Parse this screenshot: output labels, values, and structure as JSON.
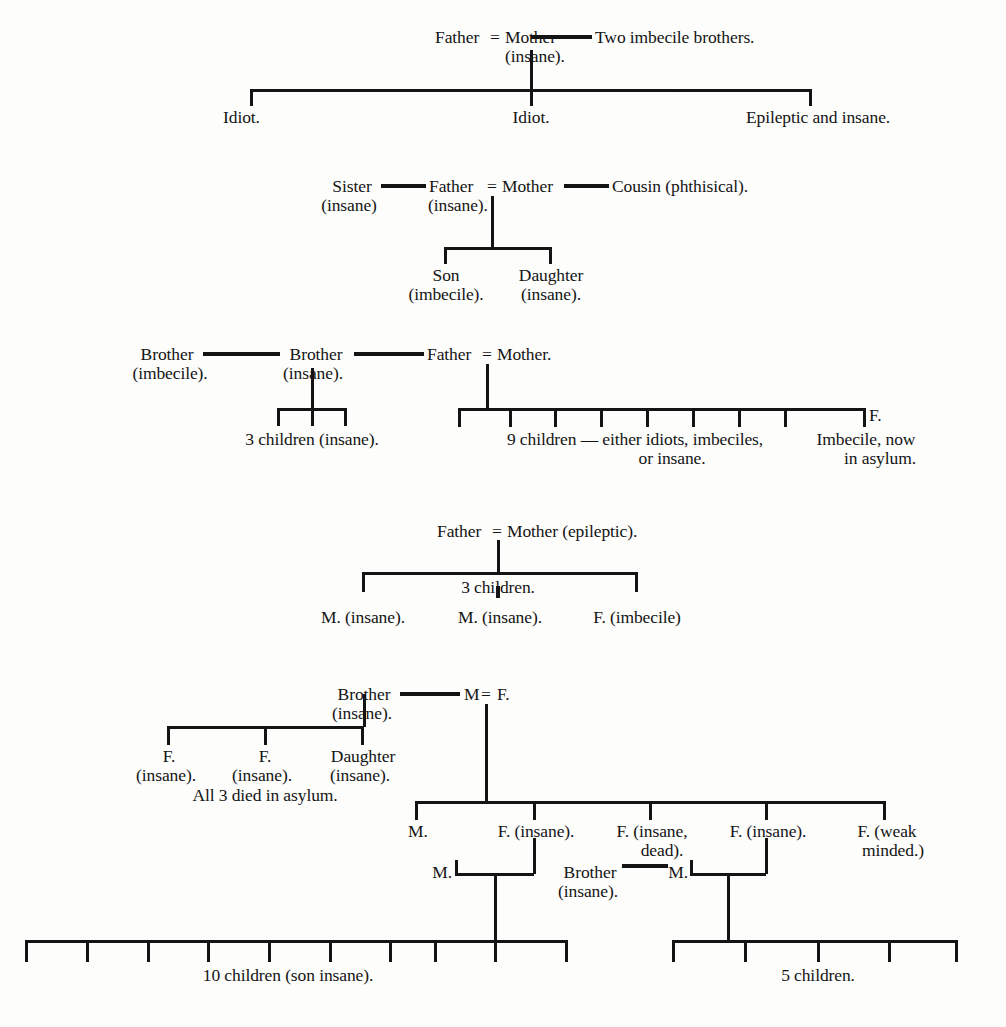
{
  "document": {
    "type": "pedigree-chart-plate",
    "title": "Family pedigrees of insanity, idiocy and imbecility",
    "ink_color": "#141414",
    "paper_color": "#fdfdfc"
  },
  "pedigrees": [
    {
      "id": "pedigree-1",
      "parents": {
        "father": "Father",
        "union_symbol": "=",
        "mother": "Mother",
        "mother_note": "(insane).",
        "collateral": "Two imbecile brothers."
      },
      "children": [
        {
          "label": "Idiot."
        },
        {
          "label": "Idiot."
        },
        {
          "label": "Epileptic and insane."
        }
      ]
    },
    {
      "id": "pedigree-2",
      "parents": {
        "collateral_left": "Sister",
        "collateral_left_note": "(insane)",
        "father": "Father",
        "father_note": "(insane).",
        "union_symbol": "=",
        "mother": "Mother",
        "collateral_right": "Cousin (phthisical)."
      },
      "children": [
        {
          "label": "Son",
          "note": "(imbecile)."
        },
        {
          "label": "Daughter",
          "note": "(insane)."
        }
      ]
    },
    {
      "id": "pedigree-3",
      "collateral_chain": [
        {
          "label": "Brother",
          "note": "(imbecile)."
        },
        {
          "label": "Brother",
          "note": "(insane)."
        }
      ],
      "parents": {
        "father": "Father",
        "union_symbol": "=",
        "mother": "Mother."
      },
      "left_sibship": {
        "caption": "3 children (insane).",
        "count": 3
      },
      "right_sibship": {
        "caption_line1": "9 children — either idiots, imbeciles,",
        "caption_line2": "or insane.",
        "count": 9,
        "last_child_marker": "F.",
        "last_child_note_line1": "Imbecile, now",
        "last_child_note_line2": "in asylum."
      }
    },
    {
      "id": "pedigree-4",
      "parents": {
        "father": "Father",
        "union_symbol": "=",
        "mother": "Mother (epileptic)."
      },
      "sibship_caption": "3 children.",
      "children": [
        {
          "label": "M. (insane)."
        },
        {
          "label": "M. (insane)."
        },
        {
          "label": "F. (imbecile)"
        }
      ]
    },
    {
      "id": "pedigree-5",
      "collateral": {
        "label": "Brother",
        "note": "(insane)."
      },
      "collateral_children": [
        {
          "label": "F.",
          "note": "(insane)."
        },
        {
          "label": "F.",
          "note": "(insane)."
        },
        {
          "label": "Daughter",
          "note": "(insane)."
        }
      ],
      "collateral_children_footnote": "All 3 died in asylum.",
      "parents": {
        "male": "M",
        "union_symbol": "=",
        "female": "F."
      },
      "children": [
        {
          "label": "M."
        },
        {
          "label": "F. (insane)."
        },
        {
          "label_line1": "F. (insane,",
          "label_line2": "dead)."
        },
        {
          "label": "F. (insane)."
        },
        {
          "label_line1": "F. (weak",
          "label_line2": "minded.)"
        }
      ],
      "unions": [
        {
          "id": "union-left",
          "spouse": "M.",
          "offspring_caption": "10 children (son insane).",
          "offspring_count": 10
        },
        {
          "id": "union-right",
          "collateral": "Brother",
          "collateral_note": "(insane).",
          "spouse": "M.",
          "offspring_caption": "5 children.",
          "offspring_count": 5
        }
      ]
    }
  ]
}
